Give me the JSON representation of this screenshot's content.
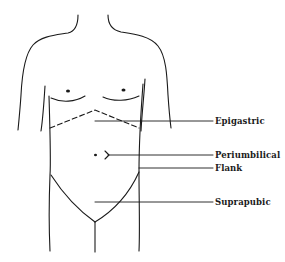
{
  "diagram": {
    "title": "",
    "colors": {
      "stroke": "#1a1a1a",
      "background": "#ffffff"
    },
    "labels": [
      {
        "id": "epigastric",
        "text": "Epigastric",
        "x": 215,
        "y": 116
      },
      {
        "id": "periumbilical",
        "text": "Periumbilical",
        "x": 215,
        "y": 150
      },
      {
        "id": "flank",
        "text": "Flank",
        "x": 215,
        "y": 163
      },
      {
        "id": "suprapubic",
        "text": "Suprapubic",
        "x": 215,
        "y": 197
      }
    ]
  }
}
